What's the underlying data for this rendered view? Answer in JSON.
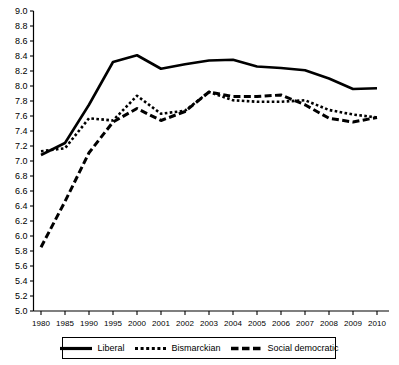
{
  "chart_data": {
    "type": "line",
    "title": "",
    "subtitle": "",
    "xlabel": "",
    "ylabel": "",
    "ylim": [
      5.0,
      9.0
    ],
    "ytick_step": 0.2,
    "grid": false,
    "legend_position": "bottom",
    "categories": [
      "1980",
      "1985",
      "1990",
      "1995",
      "2000",
      "2001",
      "2002",
      "2003",
      "2004",
      "2005",
      "2006",
      "2007",
      "2008",
      "2009",
      "2010"
    ],
    "ytick_labels": [
      "9.0",
      "8.8",
      "8.6",
      "8.4",
      "8.2",
      "8.0",
      "7.8",
      "7.6",
      "7.4",
      "7.2",
      "7.0",
      "6.8",
      "6.6",
      "6.4",
      "6.2",
      "6.0",
      "5.8",
      "5.6",
      "5.4",
      "5.2",
      "5.0"
    ],
    "series": [
      {
        "name": "Liberal",
        "style": "solid",
        "values": [
          7.08,
          7.24,
          7.75,
          8.32,
          8.41,
          8.23,
          8.29,
          8.34,
          8.35,
          8.26,
          8.24,
          8.21,
          8.1,
          7.96,
          7.97
        ]
      },
      {
        "name": "Bismarckian",
        "style": "dotted",
        "values": [
          7.13,
          7.17,
          7.57,
          7.54,
          7.87,
          7.63,
          7.67,
          7.92,
          7.81,
          7.79,
          7.79,
          7.81,
          7.68,
          7.62,
          7.58
        ]
      },
      {
        "name": "Social democratic",
        "style": "dashed",
        "values": [
          5.85,
          6.46,
          7.11,
          7.52,
          7.7,
          7.54,
          7.66,
          7.92,
          7.86,
          7.86,
          7.88,
          7.75,
          7.57,
          7.52,
          7.58
        ]
      }
    ]
  },
  "legend": {
    "items": [
      {
        "label": "Liberal",
        "swatch": "solid-line-swatch"
      },
      {
        "label": "Bismarckian",
        "swatch": "dotted-line-swatch"
      },
      {
        "label": "Social democratic",
        "swatch": "dashed-line-swatch"
      }
    ]
  }
}
